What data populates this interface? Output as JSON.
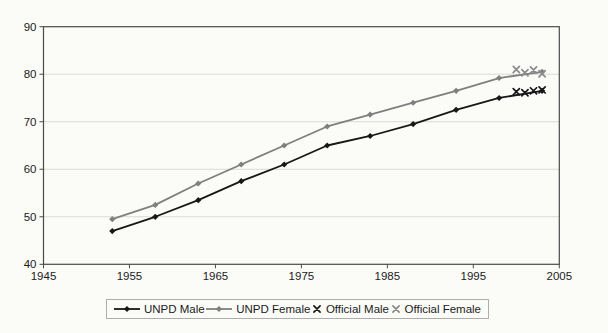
{
  "chart_data": {
    "type": "line",
    "title": "",
    "xlabel": "",
    "ylabel": "",
    "xlim": [
      1945,
      2005
    ],
    "ylim": [
      40,
      90
    ],
    "x_ticks": [
      1945,
      1955,
      1965,
      1975,
      1985,
      1995,
      2005
    ],
    "y_ticks": [
      40,
      50,
      60,
      70,
      80,
      90
    ],
    "grid": "horizontal",
    "legend_position": "bottom",
    "colors": {
      "male": "#171717",
      "female": "#7f7f7f",
      "gridline": "#d9d9d9",
      "axis": "#4a4a4a",
      "text": "#1c1c1c"
    },
    "series": [
      {
        "name": "UNPD Male",
        "type": "line",
        "marker": "diamond",
        "color": "#171717",
        "x": [
          1953,
          1958,
          1963,
          1968,
          1973,
          1978,
          1983,
          1988,
          1993,
          1998,
          2003
        ],
        "values": [
          47.0,
          50.0,
          53.5,
          57.5,
          61.0,
          65.0,
          67.0,
          69.5,
          72.5,
          75.0,
          76.5
        ]
      },
      {
        "name": "UNPD Female",
        "type": "line",
        "marker": "diamond",
        "color": "#7f7f7f",
        "x": [
          1953,
          1958,
          1963,
          1968,
          1973,
          1978,
          1983,
          1988,
          1993,
          1998,
          2003
        ],
        "values": [
          49.5,
          52.5,
          57.0,
          61.0,
          65.0,
          69.0,
          71.5,
          74.0,
          76.5,
          79.2,
          80.5
        ]
      },
      {
        "name": "Official Male",
        "type": "scatter",
        "marker": "x",
        "color": "#171717",
        "x": [
          2000,
          2001,
          2002,
          2003
        ],
        "values": [
          76.3,
          76.1,
          76.5,
          76.7
        ]
      },
      {
        "name": "Official Female",
        "type": "scatter",
        "marker": "x",
        "color": "#8a8a8a",
        "x": [
          2000,
          2001,
          2002,
          2003
        ],
        "values": [
          81.0,
          80.3,
          80.9,
          80.1
        ]
      }
    ]
  },
  "legend": {
    "items": [
      "UNPD Male",
      "UNPD Female",
      "Official Male",
      "Official Female"
    ]
  }
}
